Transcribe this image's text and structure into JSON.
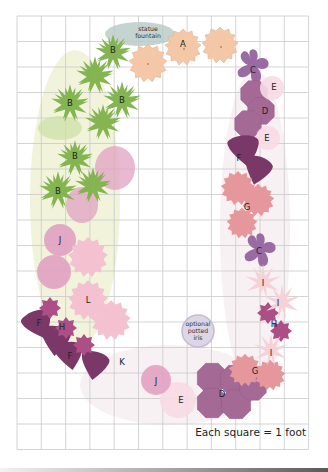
{
  "scale_note": "Each square = 1 foot",
  "grid": {
    "x0": 17,
    "y0": 16,
    "cols": 12,
    "rows": 17,
    "cell_w": 24.3,
    "cell_h": 25.5,
    "line_color": "#c9c9c9"
  },
  "fountain": {
    "label_line1": "statue",
    "label_line2": "fountain",
    "color": "#b8c9c6"
  },
  "iris": {
    "label_line1": "optional",
    "label_line2": "potted",
    "label_line3": "iris",
    "color": "#ddd6e6",
    "stroke": "#c4bad0"
  },
  "colors": {
    "A": "#f4c8a6",
    "B": "#7fb24a",
    "C": "#9a6aa3",
    "D": "#a56996",
    "E": "#f8dbe5",
    "F": "#7a3868",
    "G": "#e6979c",
    "H": "#ad4f86",
    "I": "#f5d2d8",
    "J": "#e2a2c2",
    "L": "#f3c1cf",
    "backdrop": "#e6ebbf"
  },
  "plant_labels": [
    {
      "letter": "A",
      "x": 183,
      "y": 44
    },
    {
      "letter": "B",
      "x": 113,
      "y": 50
    },
    {
      "letter": "B",
      "x": 70,
      "y": 103
    },
    {
      "letter": "B",
      "x": 122,
      "y": 100
    },
    {
      "letter": "B",
      "x": 75,
      "y": 156
    },
    {
      "letter": "B",
      "x": 58,
      "y": 191
    },
    {
      "letter": "C",
      "x": 253,
      "y": 70
    },
    {
      "letter": "C",
      "x": 259,
      "y": 251
    },
    {
      "letter": "D",
      "x": 265,
      "y": 111
    },
    {
      "letter": "D",
      "x": 222,
      "y": 394
    },
    {
      "letter": "E",
      "x": 274,
      "y": 87
    },
    {
      "letter": "E",
      "x": 267,
      "y": 138
    },
    {
      "letter": "E",
      "x": 181,
      "y": 400
    },
    {
      "letter": "F",
      "x": 239,
      "y": 158
    },
    {
      "letter": "F",
      "x": 39,
      "y": 323
    },
    {
      "letter": "F",
      "x": 70,
      "y": 356
    },
    {
      "letter": "G",
      "x": 247,
      "y": 207
    },
    {
      "letter": "G",
      "x": 255,
      "y": 371
    },
    {
      "letter": "H",
      "x": 62,
      "y": 327
    },
    {
      "letter": "H",
      "x": 274,
      "y": 324
    },
    {
      "letter": "I",
      "x": 263,
      "y": 283
    },
    {
      "letter": "I",
      "x": 278,
      "y": 303
    },
    {
      "letter": "I",
      "x": 271,
      "y": 353
    },
    {
      "letter": "J",
      "x": 60,
      "y": 240
    },
    {
      "letter": "J",
      "x": 156,
      "y": 381
    },
    {
      "letter": "K",
      "x": 122,
      "y": 362
    },
    {
      "letter": "L",
      "x": 88,
      "y": 300
    }
  ]
}
